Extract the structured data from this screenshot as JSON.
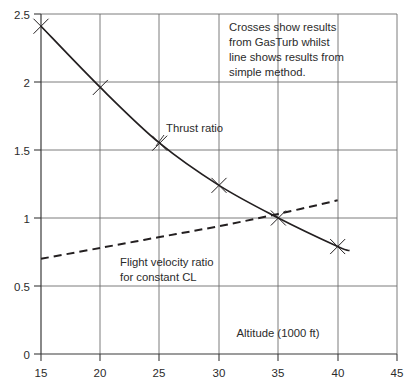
{
  "chart_data": {
    "type": "line",
    "title": "",
    "xlabel": "Altitude (1000 ft)",
    "ylabel": "",
    "xlim": [
      15,
      45
    ],
    "ylim": [
      0,
      2.5
    ],
    "xticks": [
      "15",
      "20",
      "25",
      "30",
      "35",
      "40",
      "45"
    ],
    "yticks": [
      "0",
      "0.5",
      "1",
      "1.5",
      "2",
      "2.5"
    ],
    "grid": true,
    "legend_position": "none",
    "series": [
      {
        "name": "Thrust ratio",
        "style": "solid",
        "marker": "cross",
        "color": "#231f20",
        "x": [
          15,
          20,
          25,
          30,
          35,
          40,
          41
        ],
        "values": [
          2.41,
          1.96,
          1.55,
          1.24,
          1.0,
          0.79,
          0.76
        ]
      },
      {
        "name": "Flight velocity ratio for constant CL",
        "style": "dashed",
        "marker": "none",
        "color": "#231f20",
        "x": [
          15,
          20,
          25,
          30,
          35,
          40
        ],
        "values": [
          0.7,
          0.78,
          0.86,
          0.94,
          1.03,
          1.13
        ]
      }
    ],
    "marker_points": {
      "label": "Crosses (GasTurb results)",
      "x": [
        15,
        20,
        25,
        30,
        35,
        40
      ],
      "values": [
        2.41,
        1.96,
        1.55,
        1.24,
        1.0,
        0.79
      ]
    },
    "annotations": [
      {
        "name": "note",
        "lines": [
          "Crosses show results",
          "from GasTurb whilst",
          "line shows results from",
          "simple method."
        ]
      },
      {
        "name": "thrust-ratio-label",
        "lines": [
          "Thrust ratio"
        ]
      },
      {
        "name": "flight-velocity-ratio-label",
        "lines": [
          "Flight velocity ratio",
          "for constant "
        ],
        "italic_suffix": "CL"
      }
    ]
  },
  "axis": {
    "x_label": "Altitude (1000 ft)",
    "x_ticks": [
      "15",
      "20",
      "25",
      "30",
      "35",
      "40",
      "45"
    ],
    "y_ticks": [
      "0",
      "0.5",
      "1",
      "1.5",
      "2",
      "2.5"
    ]
  },
  "note": {
    "line1": "Crosses show results",
    "line2": "from GasTurb whilst",
    "line3": "line shows results from",
    "line4": "simple method."
  },
  "labels": {
    "thrust_ratio": "Thrust ratio",
    "flight_velocity_1": "Flight velocity ratio",
    "flight_velocity_2": "for constant ",
    "flight_velocity_italic": "CL"
  },
  "colors": {
    "ink": "#231f20",
    "grid": "#6e6e6e",
    "background": "#ffffff"
  }
}
